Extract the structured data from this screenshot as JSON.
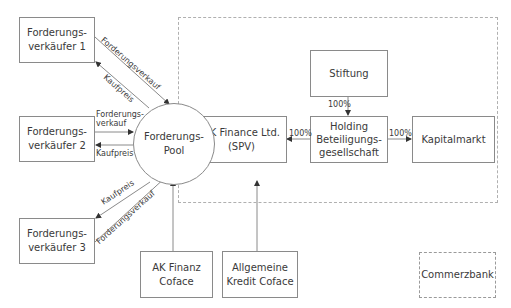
{
  "diagram": {
    "type": "flowchart",
    "title": "",
    "colors": {
      "line": "#8a8a8a",
      "text": "#3a3a3a",
      "dashed_border": "#b0b0b0",
      "background": "#ffffff"
    },
    "nodes": {
      "seller1": "Forderungs-\nverkäufer 1",
      "seller2": "Forderungs-\nverkäufer 2",
      "seller3": "Forderungs-\nverkäufer 3",
      "pool": "Forderungs-\nPool",
      "spv": "AK  Finance Ltd.\n(SPV)",
      "stiftung": "Stiftung",
      "holding": "Holding\nBeteiligungs-\ngesellschaft",
      "kapitalmarkt": "Kapitalmarkt",
      "ak_finanz_coface": "AK Finanz\nCoface",
      "allgemeine_kredit_coface": "Allgemeine\nKredit  Coface",
      "commerzbank": "Commerzbank"
    },
    "edge_labels": {
      "s1_sale": "Forderungsverkauf",
      "s1_price": "Kaufpreis",
      "s2_sale": "Forderungs-\nverkauf",
      "s2_price": "Kaufpreis",
      "s3_price": "Kaufpreis",
      "s3_sale": "Forderungsverkauf",
      "holding_spv": "100%",
      "stiftung_holding": "100%",
      "holding_kapitalmarkt": "100%"
    },
    "edges": [
      {
        "from": "seller1",
        "to": "pool",
        "label": "Forderungsverkauf"
      },
      {
        "from": "pool",
        "to": "seller1",
        "label": "Kaufpreis"
      },
      {
        "from": "seller2",
        "to": "pool",
        "label": "Forderungsverkauf"
      },
      {
        "from": "pool",
        "to": "seller2",
        "label": "Kaufpreis"
      },
      {
        "from": "pool",
        "to": "seller3",
        "label": "Kaufpreis"
      },
      {
        "from": "seller3",
        "to": "pool",
        "label": "Forderungsverkauf"
      },
      {
        "from": "holding",
        "to": "spv",
        "label": "100%"
      },
      {
        "from": "stiftung",
        "to": "holding",
        "label": "100%"
      },
      {
        "from": "holding",
        "to": "kapitalmarkt",
        "label": "100%"
      },
      {
        "from": "ak_finanz_coface",
        "to": "pool",
        "label": ""
      },
      {
        "from": "allgemeine_kredit_coface",
        "to": "spv",
        "label": ""
      }
    ]
  }
}
